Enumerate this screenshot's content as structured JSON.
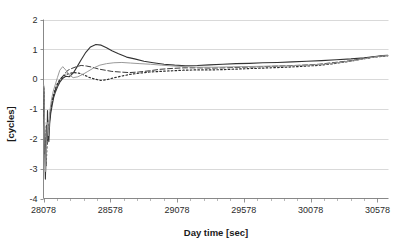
{
  "chart_data": {
    "type": "line",
    "title": "",
    "xlabel": "Day time [sec]",
    "ylabel": "[cycles]",
    "xlim": [
      28078,
      30661
    ],
    "ylim": [
      -4,
      2
    ],
    "xticks": [
      28078,
      28578,
      29078,
      29578,
      30078,
      30578
    ],
    "xtick_labels": [
      "28078",
      "28578",
      "29078",
      "29578",
      "30078",
      "30578"
    ],
    "yticks": [
      -4,
      -3,
      -2,
      -1,
      0,
      1,
      2
    ],
    "ytick_labels": [
      "-4",
      "-3",
      "-2",
      "-1",
      "0",
      "1",
      "2"
    ],
    "grid": true,
    "grid_axis": "y",
    "legend": "none",
    "minor_xticks": true,
    "series": [
      {
        "name": "series-1-solid",
        "style": "solid",
        "color": "#333333",
        "width": 1.1,
        "x": [
          28080,
          28084,
          28088,
          28092,
          28096,
          28100,
          28104,
          28108,
          28112,
          28118,
          28124,
          28132,
          28142,
          28154,
          28168,
          28184,
          28200,
          28220,
          28245,
          28270,
          28300,
          28330,
          28360,
          28395,
          28430,
          28470,
          28510,
          28550,
          28590,
          28640,
          28700,
          28760,
          28830,
          28900,
          28980,
          29060,
          29140,
          29230,
          29320,
          29420,
          29520,
          29620,
          29720,
          29830,
          29940,
          30050,
          30160,
          30270,
          30380,
          30480,
          30560,
          30620,
          30655
        ],
        "y": [
          -0.25,
          -1.25,
          -2.4,
          -3.35,
          -2.6,
          -1.55,
          -2.15,
          -1.05,
          -1.75,
          -2.1,
          -1.5,
          -1.15,
          -0.9,
          -0.62,
          -0.42,
          -0.25,
          -0.1,
          0.02,
          0.1,
          0.08,
          0.2,
          0.42,
          0.65,
          0.9,
          1.08,
          1.16,
          1.14,
          1.05,
          0.95,
          0.85,
          0.74,
          0.68,
          0.6,
          0.55,
          0.5,
          0.47,
          0.45,
          0.46,
          0.48,
          0.5,
          0.52,
          0.53,
          0.55,
          0.56,
          0.58,
          0.6,
          0.62,
          0.65,
          0.68,
          0.72,
          0.76,
          0.79,
          0.8
        ]
      },
      {
        "name": "series-2-dashed",
        "style": "dashed",
        "color": "#3a3a3a",
        "width": 1.0,
        "x": [
          28080,
          28085,
          28090,
          28095,
          28100,
          28106,
          28112,
          28120,
          28130,
          28142,
          28156,
          28172,
          28190,
          28210,
          28235,
          28262,
          28290,
          28325,
          28360,
          28400,
          28445,
          28490,
          28540,
          28590,
          28650,
          28720,
          28790,
          28870,
          28950,
          29040,
          29130,
          29230,
          29330,
          29440,
          29550,
          29660,
          29780,
          29900,
          30020,
          30140,
          30260,
          30380,
          30480,
          30560,
          30620,
          30655
        ],
        "y": [
          -0.4,
          -1.6,
          -2.5,
          -2.05,
          -2.35,
          -1.8,
          -2.05,
          -1.55,
          -1.1,
          -0.78,
          -0.5,
          -0.3,
          -0.12,
          0.02,
          0.18,
          0.3,
          0.36,
          0.42,
          0.46,
          0.44,
          0.4,
          0.34,
          0.3,
          0.26,
          0.24,
          0.22,
          0.24,
          0.28,
          0.33,
          0.36,
          0.38,
          0.38,
          0.37,
          0.38,
          0.4,
          0.41,
          0.43,
          0.45,
          0.47,
          0.5,
          0.56,
          0.62,
          0.7,
          0.75,
          0.78,
          0.79
        ]
      },
      {
        "name": "series-3-dotted",
        "style": "dotted",
        "color": "#2e2e2e",
        "width": 1.2,
        "x": [
          28080,
          28086,
          28092,
          28098,
          28104,
          28112,
          28122,
          28134,
          28148,
          28164,
          28182,
          28202,
          28225,
          28250,
          28280,
          28312,
          28345,
          28382,
          28420,
          28462,
          28505,
          28550,
          28600,
          28660,
          28725,
          28795,
          28870,
          28950,
          29035,
          29125,
          29220,
          29320,
          29425,
          29535,
          29650,
          29770,
          29890,
          30010,
          30130,
          30250,
          30370,
          30470,
          30555,
          30620,
          30655
        ],
        "y": [
          -0.3,
          -1.45,
          -2.55,
          -2.9,
          -2.2,
          -1.9,
          -1.35,
          -0.95,
          -0.62,
          -0.36,
          -0.15,
          0.0,
          0.1,
          0.16,
          0.2,
          0.22,
          0.2,
          0.14,
          0.06,
          0.0,
          -0.04,
          -0.02,
          0.04,
          0.1,
          0.16,
          0.2,
          0.24,
          0.26,
          0.28,
          0.3,
          0.31,
          0.31,
          0.32,
          0.34,
          0.36,
          0.38,
          0.4,
          0.43,
          0.46,
          0.52,
          0.6,
          0.68,
          0.74,
          0.77,
          0.785
        ]
      },
      {
        "name": "series-4-light",
        "style": "solid-light",
        "color": "#9a9a9a",
        "width": 1.0,
        "x": [
          28080,
          28084,
          28089,
          28094,
          28100,
          28107,
          28115,
          28125,
          28137,
          28150,
          28165,
          28182,
          28200,
          28222,
          28246,
          28272,
          28300,
          28335,
          28372,
          28410,
          28455,
          28500,
          28550,
          28605,
          28665,
          28730,
          28800,
          28880,
          28960,
          29050,
          29145,
          29245,
          29350,
          29460,
          29575,
          29695,
          29815,
          29935,
          30055,
          30175,
          30295,
          30400,
          30500,
          30580,
          30630,
          30655
        ],
        "y": [
          -0.2,
          -1.1,
          -2.2,
          -3.1,
          -2.3,
          -1.45,
          -1.9,
          -1.1,
          -0.7,
          -0.42,
          -0.2,
          0.05,
          0.3,
          0.42,
          0.3,
          0.14,
          0.05,
          0.08,
          0.16,
          0.26,
          0.38,
          0.47,
          0.52,
          0.55,
          0.56,
          0.54,
          0.52,
          0.5,
          0.47,
          0.44,
          0.42,
          0.4,
          0.4,
          0.41,
          0.42,
          0.43,
          0.44,
          0.45,
          0.47,
          0.5,
          0.56,
          0.62,
          0.7,
          0.76,
          0.785,
          0.79
        ]
      }
    ]
  },
  "colors": {
    "background": "#ffffff",
    "grid": "#c9c9c9",
    "axis": "#7a7a7a",
    "text": "#2b2b2b"
  }
}
